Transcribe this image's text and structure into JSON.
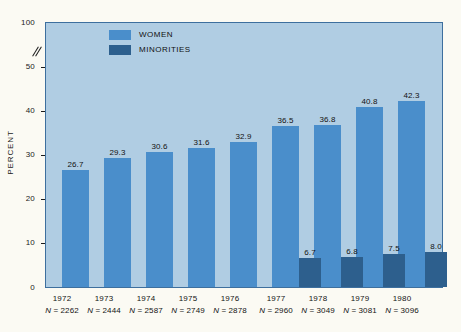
{
  "chart_data": {
    "type": "bar",
    "title": "",
    "subtitle": "",
    "xlabel": "",
    "ylabel": "PERCENT",
    "grid": false,
    "legend_position": "top-left-inside",
    "ylim": [
      0,
      100
    ],
    "y_ticks": [
      "0",
      "10",
      "20",
      "30",
      "40",
      "50",
      "100"
    ],
    "axis_break": {
      "between": [
        50,
        100
      ],
      "symbol": "//"
    },
    "categories": [
      "1972",
      "1973",
      "1974",
      "1975",
      "1976",
      "1977",
      "1978",
      "1979",
      "1980"
    ],
    "sample_sizes": [
      "N = 2262",
      "N = 2444",
      "N = 2587",
      "N = 2749",
      "N = 2878",
      "N = 2960",
      "N = 3049",
      "N = 3081",
      "N = 3096"
    ],
    "series": [
      {
        "name": "WOMEN",
        "color": "#4a8ecb",
        "values": [
          26.7,
          29.3,
          30.6,
          31.6,
          32.9,
          36.5,
          36.8,
          40.8,
          42.3
        ],
        "labels": [
          "26.7",
          "29.3",
          "30.6",
          "31.6",
          "32.9",
          "36.5",
          "36.8",
          "40.8",
          "42.3"
        ]
      },
      {
        "name": "MINORITIES",
        "color": "#2d5f8d",
        "values": [
          null,
          null,
          null,
          null,
          null,
          6.7,
          6.8,
          7.5,
          8.0
        ],
        "labels": [
          "",
          "",
          "",
          "",
          "",
          "6.7",
          "6.8",
          "7.5",
          "8.0"
        ]
      }
    ]
  },
  "legend": {
    "items": [
      {
        "label": "WOMEN",
        "color": "#4a8ecb"
      },
      {
        "label": "MINORITIES",
        "color": "#2d5f8d"
      }
    ]
  },
  "axis": {
    "y_title": "PERCENT",
    "ticks": [
      {
        "label": "100",
        "value": 100
      },
      {
        "label": "50",
        "value": 50
      },
      {
        "label": "40",
        "value": 40
      },
      {
        "label": "30",
        "value": 30
      },
      {
        "label": "20",
        "value": 20
      },
      {
        "label": "10",
        "value": 10
      },
      {
        "label": "0",
        "value": 0
      }
    ]
  },
  "colors": {
    "page_background": "#fbfaf3",
    "plot_background": "#b0cde3",
    "plot_border": "#3d6f9e",
    "women_bar": "#4a8ecb",
    "minorities_bar": "#2d5f8d",
    "text": "#141414"
  }
}
